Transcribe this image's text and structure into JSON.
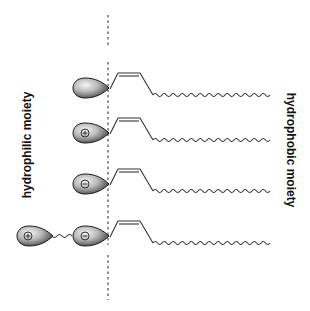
{
  "labels": {
    "left": "hydrophilic moiety",
    "right": "hydrophobic moiety"
  },
  "colors": {
    "background": "#ffffff",
    "stroke": "#333333",
    "head_light": "#f4f4f4",
    "head_dark": "#3a3a3a",
    "dash": "#555555"
  },
  "interface_line": {
    "x": 108,
    "y_top": 15,
    "y_bottom": 300,
    "style": "dashed"
  },
  "molecules": [
    {
      "row": 1,
      "head_charge": "none",
      "head_y": 87,
      "extra_head": null
    },
    {
      "row": 2,
      "head_charge": "plus",
      "head_y": 132,
      "extra_head": null
    },
    {
      "row": 3,
      "head_charge": "minus",
      "head_y": 183,
      "extra_head": null
    },
    {
      "row": 4,
      "head_charge": "minus",
      "head_y": 235,
      "extra_head": {
        "charge": "plus",
        "linker": "wavy"
      }
    }
  ],
  "tail": {
    "type": "cis-unsaturated alkyl chain",
    "wavy_end_x": 272
  }
}
